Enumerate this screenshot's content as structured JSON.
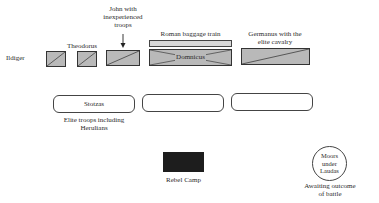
{
  "diagram": {
    "colors": {
      "unit_fill": "#b9b9b9",
      "baggage_fill": "#d9d9d9",
      "camp_fill": "#1d1d1d",
      "stroke": "#333333",
      "background": "#ffffff"
    },
    "front_line": {
      "idiger": {
        "label": "Ildiger"
      },
      "theodorus": {
        "label": "Theodorus"
      },
      "john": {
        "label": "John with inexperienced troops",
        "lines": [
          "John with",
          "inexperienced",
          "troops"
        ]
      },
      "baggage": {
        "label": "Roman baggage train"
      },
      "domnicus": {
        "label": "Domnicus"
      },
      "germanus": {
        "label": "Germanus with the elite cavalry",
        "lines": [
          "Germanus with the",
          "elite cavalry"
        ]
      }
    },
    "second_line": {
      "boxes": [
        {
          "label": "Stotzas"
        },
        {
          "label": ""
        },
        {
          "label": ""
        }
      ],
      "caption_lines": [
        "Elite troops including",
        "Herulians"
      ]
    },
    "rebel_camp": {
      "label": "Rebel Camp"
    },
    "moors": {
      "label": "Moors\nunder\nLaudas",
      "caption_lines": [
        "Awaiting outcome",
        "of battle"
      ]
    }
  }
}
